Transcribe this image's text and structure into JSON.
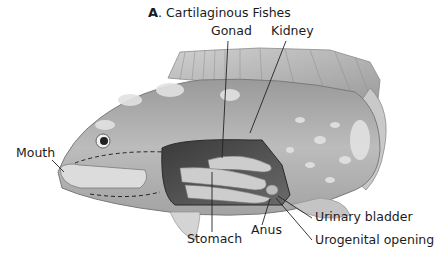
{
  "figure": {
    "title_letter": "A",
    "title_text": ". Cartilaginous Fishes",
    "labels": {
      "gonad": "Gonad",
      "kidney": "Kidney",
      "mouth": "Mouth",
      "stomach": "Stomach",
      "anus": "Anus",
      "urinary_bladder": "Urinary bladder",
      "urogenital_opening": "Urogenital opening"
    },
    "colors": {
      "body_dark": "#8a8a8a",
      "body_light": "#d6d6d6",
      "fin": "#b5b5b5",
      "cavity": "#4a4a4a",
      "organ": "#cfcfcf",
      "leader_line": "#222222"
    }
  }
}
